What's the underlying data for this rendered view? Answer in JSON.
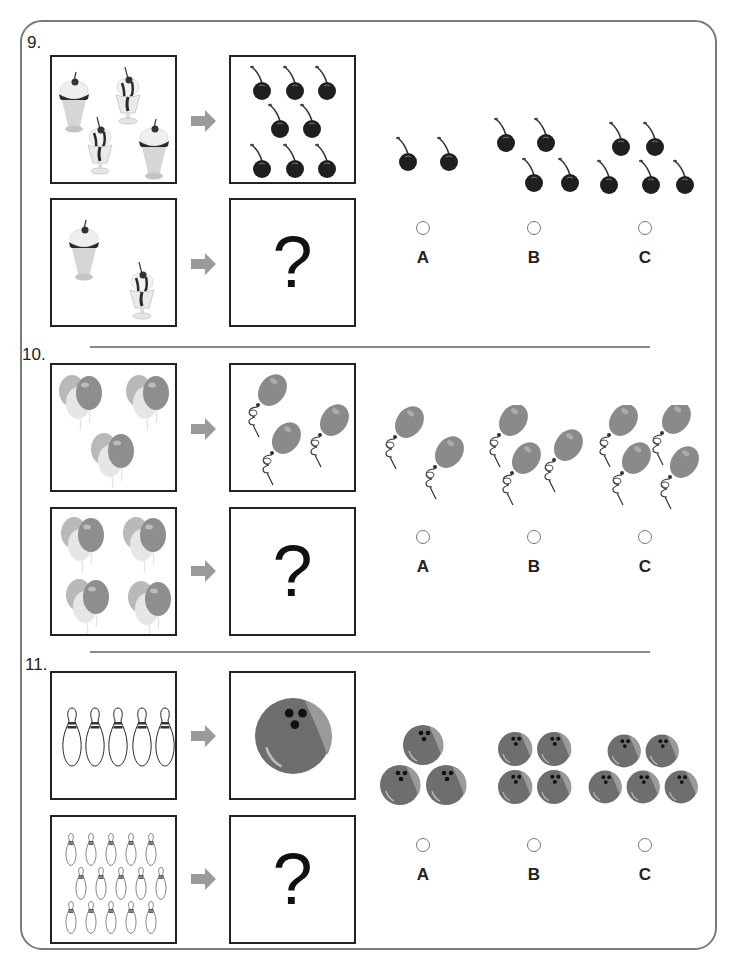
{
  "questions": [
    {
      "number": "9.",
      "row1_left": {
        "item": "ice-cream-sundae",
        "count": 4
      },
      "row1_right": {
        "item": "cherry",
        "count": 8
      },
      "row2_left": {
        "item": "ice-cream-sundae",
        "count": 2
      },
      "row2_right": {
        "symbol": "?"
      },
      "options": [
        {
          "label": "A",
          "item": "cherry",
          "count": 2
        },
        {
          "label": "B",
          "item": "cherry",
          "count": 4
        },
        {
          "label": "C",
          "item": "cherry",
          "count": 5
        }
      ]
    },
    {
      "number": "10.",
      "row1_left": {
        "item": "balloon-bunch",
        "count": 3
      },
      "row1_right": {
        "item": "balloon",
        "count": 3
      },
      "row2_left": {
        "item": "balloon-bunch",
        "count": 4
      },
      "row2_right": {
        "symbol": "?"
      },
      "options": [
        {
          "label": "A",
          "item": "balloon",
          "count": 2
        },
        {
          "label": "B",
          "item": "balloon",
          "count": 3
        },
        {
          "label": "C",
          "item": "balloon",
          "count": 4
        }
      ]
    },
    {
      "number": "11.",
      "row1_left": {
        "item": "bowling-pin",
        "count": 5
      },
      "row1_right": {
        "item": "bowling-ball",
        "count": 1
      },
      "row2_left": {
        "item": "bowling-pin",
        "count": 15
      },
      "row2_right": {
        "symbol": "?"
      },
      "options": [
        {
          "label": "A",
          "item": "bowling-ball",
          "count": 3
        },
        {
          "label": "B",
          "item": "bowling-ball",
          "count": 4
        },
        {
          "label": "C",
          "item": "bowling-ball",
          "count": 5
        }
      ]
    }
  ],
  "colors": {
    "frame": "#7a7a7a",
    "arrow": "#9a9a9a",
    "cherry": "#1f1f1f",
    "balloon": "#8a8a8a",
    "ball": "#6e6e6e"
  }
}
